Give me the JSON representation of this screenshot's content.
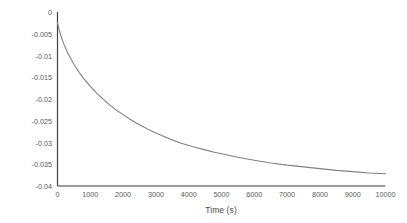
{
  "chart_data": {
    "type": "line",
    "title": "",
    "xlabel": "Time (s)",
    "ylabel": "Creep (mm)",
    "xlim": [
      0,
      10000
    ],
    "ylim": [
      -0.04,
      0
    ],
    "grid": false,
    "legend": null,
    "line_color": "#808080",
    "axis_color": "#3f3f3f",
    "tick_label_color": "#595959",
    "background": "#ffffff",
    "xticks": [
      0,
      1000,
      2000,
      3000,
      4000,
      5000,
      6000,
      7000,
      8000,
      9000,
      10000
    ],
    "xtick_labels": [
      "0",
      "1000",
      "2000",
      "3000",
      "4000",
      "5000",
      "6000",
      "7000",
      "8000",
      "9000",
      "10000"
    ],
    "yticks": [
      0,
      -0.005,
      -0.01,
      -0.015,
      -0.02,
      -0.025,
      -0.03,
      -0.035,
      -0.04
    ],
    "ytick_labels": [
      "0",
      "-0.005",
      "-0.01",
      "-0.015",
      "-0.02",
      "-0.025",
      "-0.03",
      "-0.035",
      "-0.04"
    ],
    "series": [
      {
        "name": "Creep",
        "x": [
          0,
          50,
          100,
          150,
          200,
          300,
          400,
          500,
          600,
          700,
          800,
          900,
          1000,
          1200,
          1400,
          1600,
          1800,
          2000,
          2200,
          2400,
          2600,
          2800,
          3000,
          3250,
          3500,
          3750,
          4000,
          4250,
          4500,
          4750,
          5000,
          5500,
          6000,
          6500,
          7000,
          7500,
          8000,
          8500,
          9000,
          9500,
          10000
        ],
        "y": [
          -0.0025,
          -0.0041,
          -0.0054,
          -0.0065,
          -0.0075,
          -0.0092,
          -0.0107,
          -0.012,
          -0.0132,
          -0.0143,
          -0.0153,
          -0.0162,
          -0.0171,
          -0.0187,
          -0.0201,
          -0.0214,
          -0.0226,
          -0.0236,
          -0.0246,
          -0.0255,
          -0.0263,
          -0.0271,
          -0.0278,
          -0.0286,
          -0.0294,
          -0.0301,
          -0.0307,
          -0.0312,
          -0.0317,
          -0.0322,
          -0.0326,
          -0.0334,
          -0.0341,
          -0.0347,
          -0.0352,
          -0.0356,
          -0.036,
          -0.0364,
          -0.0367,
          -0.037,
          -0.0372
        ]
      }
    ]
  }
}
